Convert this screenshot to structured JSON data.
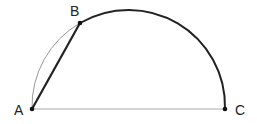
{
  "diagram": {
    "type": "geometry",
    "points": [
      {
        "label": "A",
        "x": 32,
        "y": 109
      },
      {
        "label": "B",
        "x": 80,
        "y": 23
      },
      {
        "label": "C",
        "x": 225,
        "y": 109
      }
    ],
    "segments": [
      {
        "from": "A",
        "to": "C",
        "style": "thin"
      },
      {
        "from": "A",
        "to": "B",
        "style": "bold"
      }
    ],
    "arcs": [
      {
        "from": "A",
        "to": "B",
        "style": "thin"
      },
      {
        "from": "B",
        "to": "C",
        "style": "bold"
      }
    ],
    "colors": {
      "bold": "#222222",
      "thin": "#999999",
      "point": "#111111"
    }
  }
}
